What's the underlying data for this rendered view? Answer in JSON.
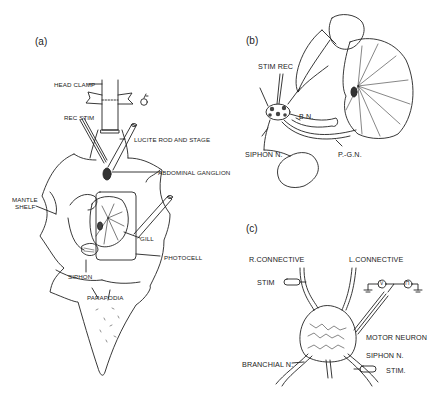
{
  "figure": {
    "panels": [
      {
        "id": "a",
        "label": "(a)",
        "annotations": {
          "head_clamp": "HEAD CLAMP",
          "rec_stim": "REC STIM",
          "lucite_rod": "LUCITE ROD AND STAGE",
          "abdominal_ganglion": "ABDOMINAL GANGLION",
          "mantle_shelf_1": "MANTLE",
          "mantle_shelf_2": "SHELF",
          "gill": "GILL",
          "photocell": "PHOTOCELL",
          "siphon": "SIPHON",
          "parapodia": "PARAPODIA"
        }
      },
      {
        "id": "b",
        "label": "(b)",
        "annotations": {
          "stim_rec": "STIM  REC",
          "bn": "B.N.",
          "siphon_n": "SIPHON N.",
          "pgn": "P.-G.N."
        }
      },
      {
        "id": "c",
        "label": "(c)",
        "annotations": {
          "r_connective": "R.CONNECTIVE",
          "l_connective": "L.CONNECTIVE",
          "stim": "STIM",
          "motor_neuron": "MOTOR NEURON",
          "siphon_n": "SIPHON N.",
          "branchial_n": "BRANCHIAL N.",
          "stim2": "STIM.",
          "voltmeter": "V",
          "pulse": "⊓"
        }
      }
    ]
  }
}
